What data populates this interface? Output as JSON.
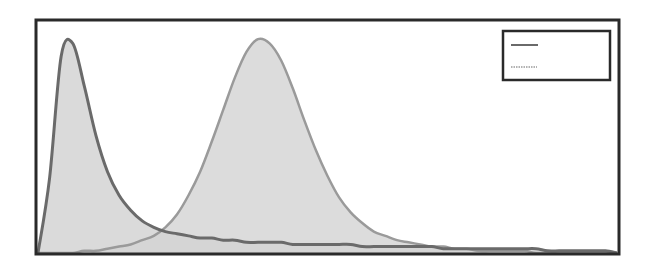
{
  "chart_data": {
    "type": "area",
    "title": "",
    "xlabel": "",
    "ylabel": "",
    "grid": false,
    "legend_position": "upper right",
    "x": [
      0,
      2,
      4,
      6,
      8,
      10,
      12,
      14,
      16,
      18,
      20,
      22,
      24,
      26,
      28,
      30,
      32,
      34,
      36,
      38,
      40,
      42,
      44,
      46,
      48,
      50,
      52,
      54,
      56,
      58,
      60,
      62,
      64,
      66,
      68,
      70,
      72,
      74,
      76,
      78,
      80,
      82,
      84,
      86,
      88,
      90,
      92,
      94,
      96,
      98,
      100
    ],
    "series": [
      {
        "name": "series 1",
        "legend_style": "solid dark line",
        "line_color": "#6a6a6a",
        "fill_color": "#d4d4d4",
        "values": [
          0.0,
          0.35,
          0.92,
          0.98,
          0.78,
          0.55,
          0.38,
          0.27,
          0.2,
          0.15,
          0.12,
          0.1,
          0.09,
          0.08,
          0.07,
          0.07,
          0.06,
          0.06,
          0.05,
          0.05,
          0.05,
          0.05,
          0.04,
          0.04,
          0.04,
          0.04,
          0.04,
          0.04,
          0.03,
          0.03,
          0.03,
          0.03,
          0.03,
          0.03,
          0.03,
          0.02,
          0.02,
          0.02,
          0.02,
          0.02,
          0.02,
          0.02,
          0.02,
          0.02,
          0.01,
          0.01,
          0.01,
          0.01,
          0.01,
          0.01,
          0.0
        ]
      },
      {
        "name": "series 2",
        "legend_style": "light dashed line",
        "line_color": "#9a9a9a",
        "fill_color": "#d6d6d6",
        "values": [
          0.0,
          0.0,
          0.0,
          0.0,
          0.01,
          0.01,
          0.02,
          0.03,
          0.04,
          0.06,
          0.08,
          0.12,
          0.18,
          0.27,
          0.38,
          0.52,
          0.67,
          0.82,
          0.94,
          1.0,
          0.98,
          0.9,
          0.77,
          0.62,
          0.48,
          0.36,
          0.26,
          0.19,
          0.14,
          0.1,
          0.08,
          0.06,
          0.05,
          0.04,
          0.03,
          0.03,
          0.02,
          0.02,
          0.01,
          0.01,
          0.01,
          0.01,
          0.01,
          0.0,
          0.0,
          0.0,
          0.0,
          0.0,
          0.0,
          0.0,
          0.0
        ]
      }
    ],
    "ylim": [
      0,
      1.08
    ],
    "xlim": [
      0,
      100
    ],
    "annotations": []
  },
  "legend": {
    "entries": [
      {
        "label": "",
        "style": "solid"
      },
      {
        "label": "",
        "style": "dashed"
      }
    ]
  }
}
